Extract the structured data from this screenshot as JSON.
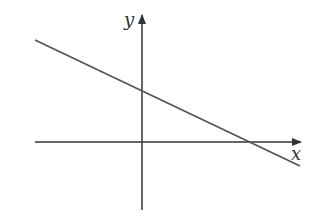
{
  "diagram": {
    "type": "coordinate-plane-line",
    "axes": {
      "x_label": "x",
      "y_label": "y"
    },
    "line": {
      "slope_sign": "negative",
      "y_intercept_sign": "positive",
      "x_intercept_sign": "positive"
    },
    "colors": {
      "axis": "#333333",
      "line": "#555555",
      "background": "#ffffff"
    }
  }
}
